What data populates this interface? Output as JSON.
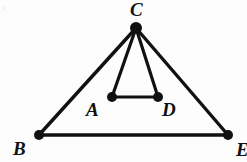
{
  "figure": {
    "kind": "geometry-diagram",
    "background_color": "#fdfdfd",
    "stroke_color": "#111111",
    "label_color": "#111111",
    "stroke_width": 3,
    "inner_stroke_width": 3,
    "dot_radius": 5,
    "apex_dot_radius": 6,
    "width": 247,
    "height": 162,
    "points": [
      {
        "id": "C",
        "label": "C",
        "x": 136,
        "y": 28,
        "dot_radius": 6,
        "label_x": 130,
        "label_y": 0
      },
      {
        "id": "B",
        "label": "B",
        "x": 39,
        "y": 135,
        "dot_radius": 5,
        "label_x": 13,
        "label_y": 139
      },
      {
        "id": "E",
        "label": "E",
        "x": 228,
        "y": 135,
        "dot_radius": 5,
        "label_x": 236,
        "label_y": 140
      },
      {
        "id": "A",
        "label": "A",
        "x": 112,
        "y": 97,
        "dot_radius": 5,
        "label_x": 86,
        "label_y": 100
      },
      {
        "id": "D",
        "label": "D",
        "x": 158,
        "y": 97,
        "dot_radius": 5,
        "label_x": 162,
        "label_y": 100
      }
    ],
    "segments": [
      {
        "id": "CB",
        "from": "C",
        "to": "B",
        "width": 3.4,
        "group": "outer-triangle"
      },
      {
        "id": "CE",
        "from": "C",
        "to": "E",
        "width": 3.4,
        "group": "outer-triangle"
      },
      {
        "id": "BE",
        "from": "B",
        "to": "E",
        "width": 3.4,
        "group": "outer-triangle"
      },
      {
        "id": "CA",
        "from": "C",
        "to": "A",
        "width": 3.2,
        "group": "inner-triangle"
      },
      {
        "id": "CD",
        "from": "C",
        "to": "D",
        "width": 3.2,
        "group": "inner-triangle"
      },
      {
        "id": "AD",
        "from": "A",
        "to": "D",
        "width": 3.2,
        "group": "inner-triangle"
      }
    ],
    "artifacts": [
      {
        "id": "corner-speck",
        "x": 2,
        "y": 4
      }
    ]
  }
}
